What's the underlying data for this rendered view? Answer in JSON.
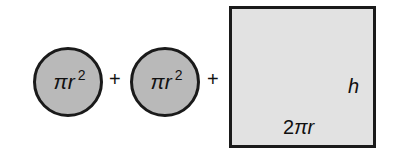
{
  "diagram": {
    "terms": [
      {
        "shape": "circle",
        "label_base": "πr",
        "label_exp": "2",
        "fill": "#b9b9b9"
      },
      {
        "shape": "circle",
        "label_base": "πr",
        "label_exp": "2",
        "fill": "#b9b9b9"
      },
      {
        "shape": "rectangle",
        "height_label": "h",
        "width_label_num": "2",
        "width_label_var": "πr",
        "fill": "#e2e2e2"
      }
    ],
    "operators": [
      "+",
      "+"
    ]
  }
}
